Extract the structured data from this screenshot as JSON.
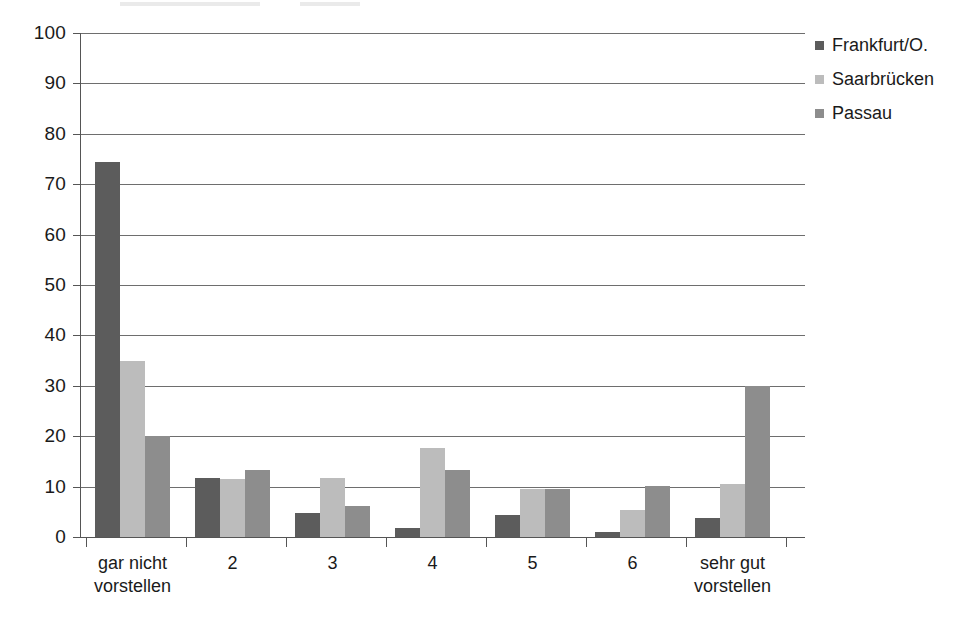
{
  "chart_data": {
    "type": "bar",
    "title": "",
    "subtitle": "",
    "xlabel": "",
    "ylabel": "",
    "ylim": [
      0,
      100
    ],
    "ytick_step": 10,
    "yticks": [
      0,
      10,
      20,
      30,
      40,
      50,
      60,
      70,
      80,
      90,
      100
    ],
    "ytick_labels": [
      "0",
      "10",
      "20",
      "30",
      "40",
      "50",
      "60",
      "70",
      "80",
      "90",
      "100"
    ],
    "grid": true,
    "grid_axis": "y",
    "legend_position": "top-right",
    "categories": [
      "gar nicht vorstellen",
      "2",
      "3",
      "4",
      "5",
      "6",
      "sehr gut vorstellen"
    ],
    "category_lines": [
      [
        "gar nicht",
        "vorstellen"
      ],
      [
        "2",
        ""
      ],
      [
        "3",
        ""
      ],
      [
        "4",
        ""
      ],
      [
        "5",
        ""
      ],
      [
        "6",
        ""
      ],
      [
        "sehr gut",
        "vorstellen"
      ]
    ],
    "series": [
      {
        "name": "Frankfurt/O.",
        "color": "#5c5c5c",
        "values": [
          74.5,
          11.8,
          4.7,
          1.7,
          4.3,
          1.0,
          3.7
        ]
      },
      {
        "name": "Saarbrücken",
        "color": "#bcbcbc",
        "values": [
          35.0,
          11.5,
          11.8,
          17.7,
          9.6,
          5.3,
          10.6
        ]
      },
      {
        "name": "Passau",
        "color": "#8d8d8d",
        "values": [
          20.0,
          13.3,
          6.2,
          13.3,
          9.6,
          10.2,
          29.9
        ]
      }
    ]
  },
  "legend": {
    "items": [
      {
        "label": "Frankfurt/O."
      },
      {
        "label": "Saarbrücken"
      },
      {
        "label": "Passau"
      }
    ]
  }
}
